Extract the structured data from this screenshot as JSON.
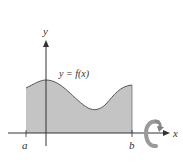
{
  "diagram": {
    "curve_label": "y = f(x)",
    "x_axis_label": "x",
    "y_axis_label": "y",
    "left_bound_label": "a",
    "right_bound_label": "b",
    "rotation_icon": "rotate-around-x-axis-icon",
    "colors": {
      "region_fill": "#c4c4c4",
      "curve_stroke": "#555555",
      "axis": "#333333",
      "rotation_arrow": "#9a9a9a"
    }
  }
}
